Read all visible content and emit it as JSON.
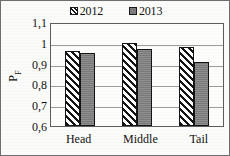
{
  "chart_data": {
    "type": "bar",
    "title": "",
    "xlabel": "",
    "ylabel": "P_F",
    "ylabel_base": "P",
    "ylabel_sub": "F",
    "categories": [
      "Head",
      "Middle",
      "Tail"
    ],
    "series": [
      {
        "name": "2012",
        "values": [
          0.96,
          1.0,
          0.98
        ],
        "fill": "diagonal-hatch",
        "color": "#ffffff",
        "hatch_color": "#151515"
      },
      {
        "name": "2013",
        "values": [
          0.95,
          0.97,
          0.91
        ],
        "fill": "solid",
        "color": "#7f7f7f",
        "hatch_color": ""
      }
    ],
    "ylim": [
      0.6,
      1.1
    ],
    "ytick_values": [
      1.1,
      1.0,
      0.9,
      0.8,
      0.7,
      0.6
    ],
    "ytick_labels": [
      "1,1",
      "1",
      "0,9",
      "0,8",
      "0,7",
      "0,6"
    ],
    "grid": "horizontal",
    "legend_position": "top-center",
    "decimal_separator": ","
  },
  "legend": {
    "entries": [
      {
        "label": "2012",
        "swatch": "hatch-swatch"
      },
      {
        "label": "2013",
        "swatch": "solid-swatch"
      }
    ]
  },
  "colors": {
    "series_2012": "#ffffff",
    "series_2013": "#7f7f7f",
    "hatch": "#151515",
    "axis": "#5d5d5d",
    "gridline": "#9b9b9b",
    "text": "#121212",
    "background": "#fbfbf9"
  }
}
